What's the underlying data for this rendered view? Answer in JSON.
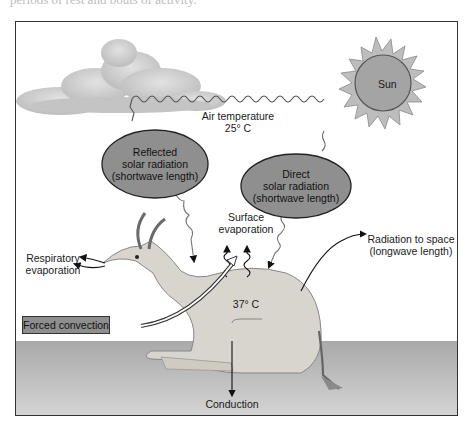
{
  "caption_fragment": "periods of rest and bouts of activity.",
  "diagram": {
    "labels": {
      "sun": "Sun",
      "air_temperature_line1": "Air temperature",
      "air_temperature_line2": "25° C",
      "reflected_line1": "Reflected",
      "reflected_line2": "solar radiation",
      "reflected_line3": "(shortwave length)",
      "direct_line1": "Direct",
      "direct_line2": "solar radiation",
      "direct_line3": "(shortwave length)",
      "surface_line1": "Surface",
      "surface_line2": "evaporation",
      "respiratory_line1": "Respiratory",
      "respiratory_line2": "evaporation",
      "radiation_space_line1": "Radiation to space",
      "radiation_space_line2": "(longwave length)",
      "body_temperature": "37° C",
      "forced_convection": "Forced convection",
      "conduction": "Conduction"
    },
    "colors": {
      "ellipse_fill": "#8f8f8f",
      "sun_fill": "#a9a9a9",
      "cloud_fill": "#c8c8c8",
      "ground_fill": "#b4b4b4",
      "animal_fill": "#d6d2cc",
      "frame_stroke": "#333333"
    }
  }
}
